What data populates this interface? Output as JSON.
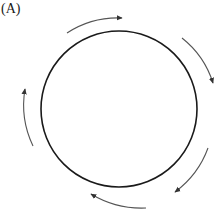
{
  "panel": {
    "label": "(A)"
  },
  "diagram": {
    "shape": "circle",
    "circle": {
      "cx": 119,
      "cy": 109,
      "r": 78,
      "stroke": "#1a1a1a",
      "stroke_width": 1.6
    },
    "arrow_color": "#555555",
    "direction": "clockwise",
    "arrows": [
      {
        "name": "top-arrow",
        "from": [
          67,
          33
        ],
        "to": [
          122,
          19
        ]
      },
      {
        "name": "upper-right-arrow",
        "from": [
          183,
          38
        ],
        "to": [
          214,
          83
        ]
      },
      {
        "name": "lower-right-arrow",
        "from": [
          208,
          149
        ],
        "to": [
          175,
          193
        ]
      },
      {
        "name": "bottom-arrow",
        "from": [
          146,
          209
        ],
        "to": [
          91,
          194
        ]
      },
      {
        "name": "left-arrow",
        "from": [
          33,
          146
        ],
        "to": [
          25,
          90
        ]
      }
    ]
  }
}
